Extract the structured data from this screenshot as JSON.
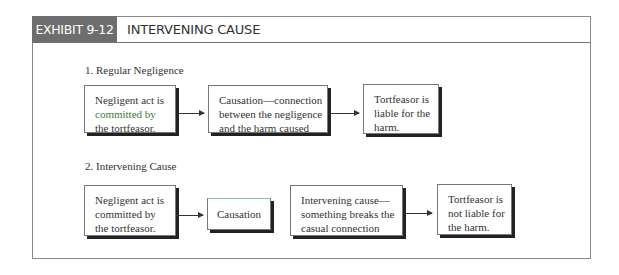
{
  "exhibit": {
    "tag": "EXHIBIT 9-12",
    "title": "INTERVENING CAUSE"
  },
  "sections": [
    {
      "heading": "1.  Regular Negligence",
      "boxes": [
        {
          "line1": "Negligent act is",
          "line2": "committed by",
          "line3": "the tortfeasor."
        },
        {
          "line1": "Causation—connection",
          "line2": "between the negligence",
          "line3": "and the harm caused"
        },
        {
          "line1": "Tortfeasor is",
          "line2": "liable for the",
          "line3": "harm."
        }
      ]
    },
    {
      "heading": "2.  Intervening Cause",
      "boxes": [
        {
          "line1": "Negligent act is",
          "line2": "committed by",
          "line3": "the tortfeasor."
        },
        {
          "line1": "Causation"
        },
        {
          "line1": "Intervening cause—",
          "line2": "something breaks the",
          "line3": "casual connection"
        },
        {
          "line1": "Tortfeasor is",
          "line2": "not liable for",
          "line3": "the harm."
        }
      ]
    }
  ]
}
